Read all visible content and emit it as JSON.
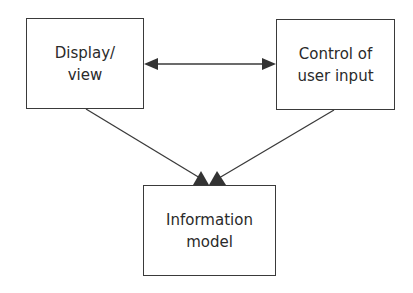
{
  "diagram": {
    "type": "block-diagram",
    "nodes": [
      {
        "id": "display",
        "lines": [
          "Display/",
          "view"
        ]
      },
      {
        "id": "control",
        "lines": [
          "Control of",
          "user input"
        ]
      },
      {
        "id": "model",
        "lines": [
          "Information",
          "model"
        ]
      }
    ],
    "edges": [
      {
        "from": "display",
        "to": "control",
        "direction": "bidirectional"
      },
      {
        "from": "display",
        "to": "model",
        "direction": "forward"
      },
      {
        "from": "control",
        "to": "model",
        "direction": "forward"
      }
    ],
    "colors": {
      "stroke": "#3a3a3a",
      "background": "#ffffff",
      "text": "#2a2a2a"
    }
  }
}
